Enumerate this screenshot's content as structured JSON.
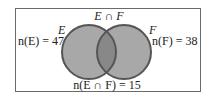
{
  "diagram": {
    "type": "venn",
    "sets": [
      {
        "name": "E",
        "label": "E",
        "count_label": "n(E) = 47",
        "count": 47
      },
      {
        "name": "F",
        "label": "F",
        "count_label": "n(F) = 38",
        "count": 38
      }
    ],
    "intersection": {
      "label": "E ∩ F",
      "count_label": "n(E ∩ F) = 15",
      "count": 15
    },
    "colors": {
      "circle_fill": "#a8a8a8",
      "intersection_fill": "#888888",
      "circle_stroke": "#555555",
      "frame_stroke": "#6a6a6a"
    }
  }
}
